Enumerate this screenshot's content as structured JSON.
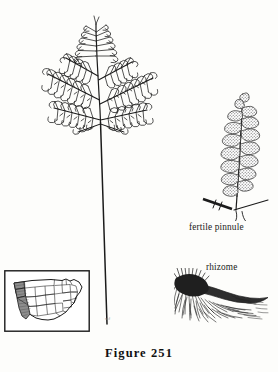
{
  "figure": {
    "caption": "Figure 251",
    "background_color": "#fdfdfb",
    "ink_color": "#1b1b1b"
  },
  "labels": {
    "fertile_pinnule": "fertile pinnule",
    "rhizome": "rhizome"
  },
  "artist_credit": "scf",
  "panels": {
    "whole_frond": {
      "name": "whole-frond-illustration",
      "description": "deltoid tripinnate fern blade on long bare stipe"
    },
    "fertile_pinnule": {
      "name": "fertile-pinnule-illustration",
      "description": "enlarged pinnule with stippled sori-bearing lobes and scale bar"
    },
    "rhizome": {
      "name": "rhizome-illustration",
      "description": "dark creeping rhizome with dense fibrous roots"
    },
    "range_map": {
      "name": "us-range-map-inset",
      "description": "outline map of the contiguous United States with shaded western distribution",
      "shaded_region_color": "#8d8d8d",
      "border_color": "#1b1b1b"
    }
  }
}
